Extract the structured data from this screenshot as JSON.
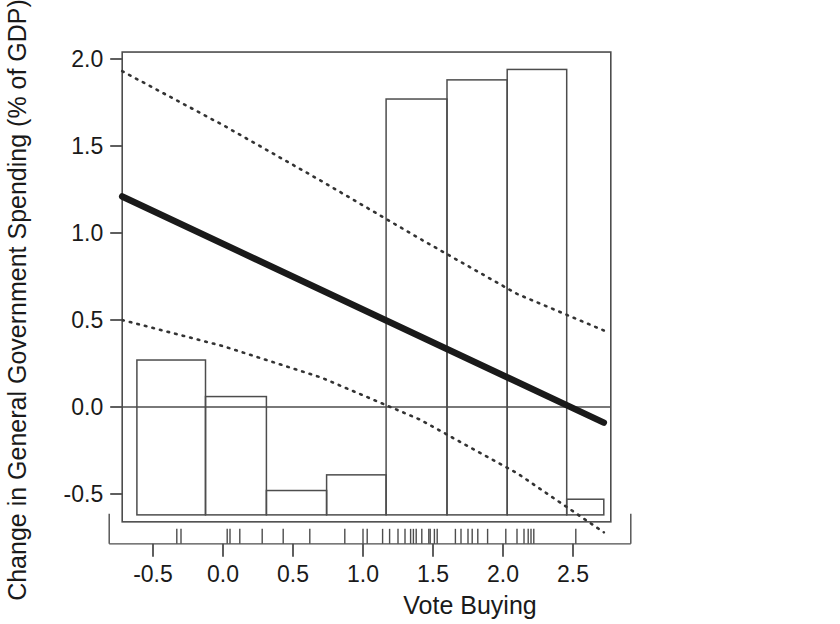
{
  "chart_data": {
    "type": "bar",
    "title": "",
    "subtitle": "",
    "xlabel": "Vote Buying",
    "ylabel": "Change in General Government Spending (% of GDP)",
    "xlim": [
      -0.72,
      2.77
    ],
    "ylim": [
      -0.66,
      2.04
    ],
    "xticks": [
      -0.5,
      0.0,
      0.5,
      1.0,
      1.5,
      2.0,
      2.5
    ],
    "xticklabels": [
      "-0.5",
      "0.0",
      "0.5",
      "1.0",
      "1.5",
      "2.0",
      "2.5"
    ],
    "yticks": [
      -0.5,
      0.0,
      0.5,
      1.0,
      1.5,
      2.0
    ],
    "yticklabels": [
      "-0.5",
      "0.0",
      "0.5",
      "1.0",
      "1.5",
      "2.0"
    ],
    "grid": false,
    "legend": "none",
    "zero_line": 0.0,
    "histogram": {
      "name": "Binned mean change in spending",
      "bin_edges": [
        -0.615,
        -0.125,
        0.31,
        0.74,
        1.165,
        1.6,
        2.03,
        2.455,
        2.72
      ],
      "bar_baseline": -0.62,
      "bars": [
        {
          "x_left": -0.615,
          "x_right": -0.125,
          "top": 0.27
        },
        {
          "x_left": -0.125,
          "x_right": 0.31,
          "top": 0.06
        },
        {
          "x_left": 0.31,
          "x_right": 0.74,
          "top": -0.48
        },
        {
          "x_left": 0.74,
          "x_right": 1.165,
          "top": -0.39
        },
        {
          "x_left": 1.165,
          "x_right": 1.6,
          "top": 1.77
        },
        {
          "x_left": 1.6,
          "x_right": 2.03,
          "top": 1.88
        },
        {
          "x_left": 2.03,
          "x_right": 2.455,
          "top": 1.94
        },
        {
          "x_left": 2.455,
          "x_right": 2.72,
          "top": -0.53
        }
      ]
    },
    "series": [
      {
        "name": "Fitted regression line",
        "style": "solid-thick",
        "color": "#1a1a1a",
        "x": [
          -0.72,
          2.72
        ],
        "y": [
          1.21,
          -0.09
        ]
      },
      {
        "name": "Upper 95% confidence band",
        "style": "dotted",
        "color": "#333333",
        "x": [
          -0.72,
          0.0,
          0.7,
          1.4,
          2.1,
          2.72
        ],
        "y": [
          1.93,
          1.62,
          1.3,
          0.97,
          0.65,
          0.44
        ]
      },
      {
        "name": "Lower 95% confidence band",
        "style": "dotted",
        "color": "#333333",
        "x": [
          -0.72,
          0.0,
          0.7,
          1.4,
          2.1,
          2.72
        ],
        "y": [
          0.5,
          0.35,
          0.17,
          -0.07,
          -0.38,
          -0.72
        ]
      }
    ],
    "rug": {
      "name": "Observation rug marks",
      "values": [
        -0.33,
        -0.3,
        0.03,
        0.05,
        0.12,
        0.28,
        0.43,
        0.62,
        0.87,
        1.0,
        1.03,
        1.14,
        1.19,
        1.25,
        1.3,
        1.34,
        1.36,
        1.38,
        1.42,
        1.47,
        1.48,
        1.51,
        1.53,
        1.66,
        1.7,
        1.75,
        1.78,
        1.82,
        1.89,
        2.02,
        2.1,
        2.15,
        2.18,
        2.2,
        2.22,
        2.52
      ]
    }
  }
}
